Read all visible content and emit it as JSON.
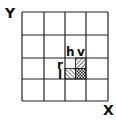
{
  "diagram": {
    "axes": {
      "y_label": "Y",
      "x_label": "X"
    },
    "grid": {
      "rows": 4,
      "cols": 4,
      "line_color": "#222222",
      "background": "#ffffff"
    },
    "highlighted_cell": {
      "row": 2,
      "col": 2,
      "subdivisions": 2
    },
    "quadrant_labels": {
      "top_left_col": "h",
      "top_right_col": "v",
      "left_top_row": "r",
      "left_bottom_row": "l"
    },
    "quadrants": [
      {
        "position": "top-left",
        "fill": "none"
      },
      {
        "position": "top-right",
        "fill": "diagonal-hatch-down"
      },
      {
        "position": "bottom-left",
        "fill": "diagonal-hatch-up"
      },
      {
        "position": "bottom-right",
        "fill": "cross-hatch"
      }
    ]
  }
}
